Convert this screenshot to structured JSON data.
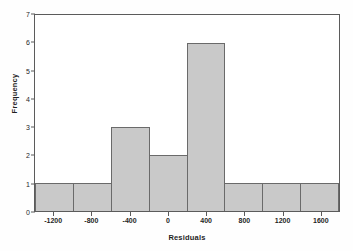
{
  "chart_data": {
    "type": "bar",
    "title": "",
    "xlabel": "Residuals",
    "ylabel": "Frequency",
    "categories": [
      "-1200",
      "-800",
      "-400",
      "0",
      "400",
      "800",
      "1200",
      "1600"
    ],
    "values": [
      1,
      1,
      3,
      2,
      6,
      1,
      1,
      1
    ],
    "xtick_labels": [
      "-1200",
      "-800",
      "-400",
      "0",
      "400",
      "800",
      "1200",
      "1600"
    ],
    "ytick_labels": [
      "0",
      "1",
      "2",
      "3",
      "4",
      "5",
      "6",
      "7"
    ],
    "ylim": [
      0,
      7
    ],
    "ytick_step": 1,
    "xtick_step": 400,
    "grid": false,
    "legend": false,
    "bar_fill_color": "#c9c9c9",
    "bar_border_color": "#6a6a6a",
    "axis_color": "#5b5b5b",
    "background_color": "#ffffff"
  }
}
